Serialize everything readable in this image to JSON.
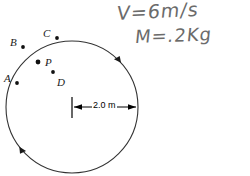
{
  "figure": {
    "circle": {
      "center_x": 72,
      "center_y": 107,
      "radius": 66,
      "stroke_color": "#333333"
    },
    "direction_arrows": [
      {
        "name": "arrow-upper-right",
        "angle_deg": -42
      },
      {
        "name": "arrow-lower-left",
        "angle_deg": 143
      }
    ],
    "points": [
      {
        "id": "A",
        "label": "A",
        "label_x": 4,
        "label_y": 73,
        "dot_x": 17,
        "dot_y": 83,
        "on_circle": false
      },
      {
        "id": "B",
        "label": "B",
        "label_x": 10,
        "label_y": 37,
        "dot_x": 23,
        "dot_y": 47,
        "on_circle": false
      },
      {
        "id": "C",
        "label": "C",
        "label_x": 43,
        "label_y": 28,
        "dot_x": 57,
        "dot_y": 38,
        "on_circle": false
      },
      {
        "id": "P",
        "label": "P",
        "label_x": 45,
        "label_y": 57,
        "dot_x": 38,
        "dot_y": 62,
        "on_circle": true
      },
      {
        "id": "D",
        "label": "D",
        "label_x": 57,
        "label_y": 79,
        "dot_x": 53,
        "dot_y": 72,
        "on_circle": false
      }
    ],
    "dimension": {
      "label": "2.0 m",
      "label_x": 92,
      "label_y": 103,
      "from_x": 72,
      "to_x": 138,
      "y": 107,
      "tick_top": 97,
      "tick_bottom": 118
    }
  },
  "annotations": {
    "velocity_note": "V=6m/s",
    "mass_note": "M=.2Kg",
    "ink_color": "#6b6b6b"
  }
}
